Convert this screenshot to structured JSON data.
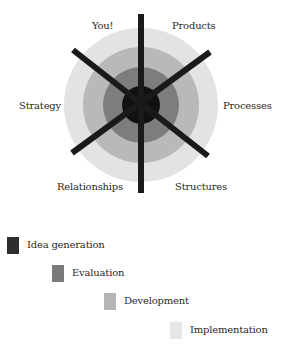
{
  "diagram": {
    "center": {
      "x": 141,
      "y": 105
    },
    "rings": [
      {
        "name": "Implementation",
        "radius": 77,
        "color": "#e3e3e3"
      },
      {
        "name": "Development",
        "radius": 58,
        "color": "#b9b9b9"
      },
      {
        "name": "Evaluation",
        "radius": 38,
        "color": "#7d7d7d"
      },
      {
        "name": "Idea generation",
        "radius": 19,
        "color": "#111111"
      }
    ],
    "spokes_color": "#1a1a1a",
    "labels": {
      "you": "You!",
      "products": "Products",
      "strategy": "Strategy",
      "processes": "Processes",
      "relationships": "Relationships",
      "structures": "Structures"
    }
  },
  "legend": {
    "items": [
      {
        "label": "Idea generation",
        "color": "#2e2e2e"
      },
      {
        "label": "Evaluation",
        "color": "#7a7a7a"
      },
      {
        "label": "Development",
        "color": "#b5b5b5"
      },
      {
        "label": "Implementation",
        "color": "#e6e6e6"
      }
    ]
  }
}
